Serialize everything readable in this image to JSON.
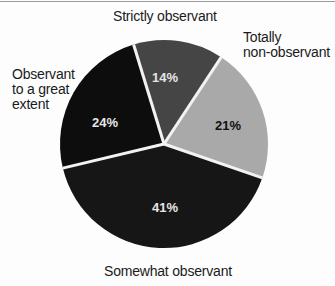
{
  "chart_data": {
    "type": "pie",
    "title": "",
    "start_angle_deg": -17,
    "slices": [
      {
        "label": "Strictly observant",
        "value": 14,
        "value_label": "14%",
        "color": "#454545",
        "text_color": "#e6e6e6"
      },
      {
        "label": "Totally non-observant",
        "value": 21,
        "value_label": "21%",
        "color": "#a9a9a9",
        "text_color": "#111111"
      },
      {
        "label": "Somewhat observant",
        "value": 41,
        "value_label": "41%",
        "color": "#161616",
        "text_color": "#e6e6e6"
      },
      {
        "label": "Observant to a great extent",
        "value": 24,
        "value_label": "24%",
        "color": "#0d0d0d",
        "text_color": "#e6e6e6"
      }
    ],
    "legend": "none (direct labels)",
    "separator_color": "#f2f2f2"
  },
  "labels": {
    "strictly": "Strictly observant",
    "totally_line1": "Totally",
    "totally_line2": "non-observant",
    "great_line1": "Observant",
    "great_line2": "to a great",
    "great_line3": "extent",
    "somewhat": "Somewhat observant"
  }
}
